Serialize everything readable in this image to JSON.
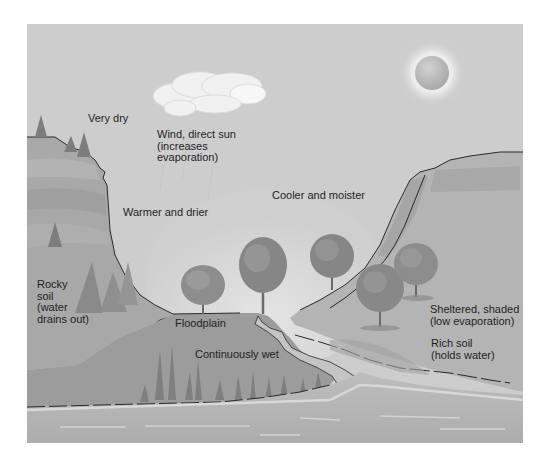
{
  "diagram": {
    "type": "landscape-cross-section",
    "colors": {
      "background": "#ffffff",
      "sky": "#cfcfcf",
      "hill_left": "#a9a9a9",
      "hill_right": "#b5b5b5",
      "floodplain": "#9a9a9a",
      "water": "#b8b8b8",
      "tree_foliage": "#8c8c8c",
      "outline": "#2a2a2a",
      "cloud": "#f2f2f2",
      "sun": "#bdbdbd",
      "sun_glow": "#ececec",
      "text": "#1f1f1f"
    },
    "labels": {
      "very_dry": [
        "Very dry"
      ],
      "wind_sun": [
        "Wind, direct sun",
        "(increases",
        "evaporation)"
      ],
      "warmer_drier": [
        "Warmer and drier"
      ],
      "cooler_moister": [
        "Cooler and moister"
      ],
      "rocky_soil": [
        "Rocky",
        "soil",
        "(water",
        "drains out)"
      ],
      "floodplain": [
        "Floodplain"
      ],
      "continuously_wet": [
        "Continuously wet"
      ],
      "sheltered": [
        "Sheltered, shaded",
        "(low evaporation)"
      ],
      "rich_soil": [
        "Rich soil",
        "(holds water)"
      ]
    },
    "elements": [
      "sky",
      "sun",
      "cloud",
      "left-cliff",
      "conifer-trees",
      "right-hillside",
      "deciduous-trees",
      "floodplain",
      "stream",
      "marsh-reeds",
      "river"
    ]
  }
}
